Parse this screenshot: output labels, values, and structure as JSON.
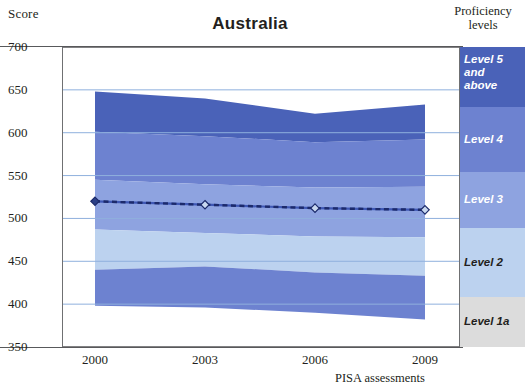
{
  "title": "Australia",
  "axis": {
    "y_label": "Score",
    "y_ticks": [
      700,
      650,
      600,
      550,
      500,
      450,
      400,
      350
    ],
    "x_ticks": [
      "2000",
      "2003",
      "2006",
      "2009"
    ],
    "x_label": "PISA assessments"
  },
  "legend": {
    "title_line1": "Proficiency",
    "title_line2": "levels",
    "items": [
      {
        "label": "Level 5\nand\nabove",
        "label_l1": "Level 5",
        "label_l2": "and",
        "label_l3": "above",
        "color": "#4a62b8"
      },
      {
        "label": "Level 4",
        "color": "#6d82d0"
      },
      {
        "label": "Level 3",
        "color": "#8ea3e0"
      },
      {
        "label": "Level 2",
        "color": "#bcd2ef"
      },
      {
        "label": "Level 1a",
        "color": "#dcdcdc"
      }
    ]
  },
  "chart_data": {
    "type": "area",
    "title": "Australia",
    "xlabel": "PISA assessments",
    "ylabel": "Score",
    "ylim": [
      350,
      700
    ],
    "grid": true,
    "legend_position": "right",
    "x": [
      "2000",
      "2003",
      "2006",
      "2009"
    ],
    "bands": [
      {
        "name": "Level 5 and above",
        "color": "#4a62b8",
        "upper": [
          648,
          640,
          622,
          633
        ],
        "lower": [
          601,
          596,
          589,
          592
        ]
      },
      {
        "name": "Level 4",
        "color": "#6d82d0",
        "upper": [
          601,
          596,
          589,
          592
        ],
        "lower": [
          545,
          540,
          536,
          537
        ]
      },
      {
        "name": "Level 3",
        "color": "#8ea3e0",
        "upper": [
          545,
          540,
          536,
          537
        ],
        "lower": [
          487,
          483,
          479,
          478
        ]
      },
      {
        "name": "Level 2",
        "color": "#bcd2ef",
        "upper": [
          487,
          483,
          479,
          478
        ],
        "lower": [
          440,
          444,
          437,
          433
        ]
      },
      {
        "name": "Level 1a",
        "color": "#6d82d0",
        "upper": [
          440,
          444,
          437,
          433
        ],
        "lower": [
          398,
          396,
          390,
          382
        ]
      }
    ],
    "series": [
      {
        "name": "Mean score",
        "values": [
          520,
          516,
          512,
          510
        ],
        "color": "#1c2a6b",
        "style": "dashed",
        "marker": "diamond"
      }
    ]
  }
}
